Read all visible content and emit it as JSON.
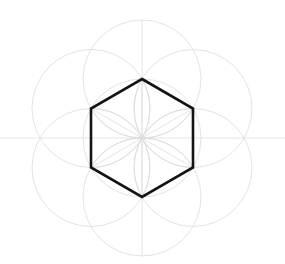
{
  "figure": {
    "background_color": "#ffffff"
  },
  "canvas": {
    "width": 285,
    "height": 264
  },
  "chart_data": {
    "type": "scatter",
    "xlabel": "",
    "ylabel": "",
    "xlim": [
      0,
      285
    ],
    "ylim": [
      0,
      264
    ],
    "grid": false,
    "legend": "none",
    "center": {
      "x": 142,
      "y": 138
    },
    "radius": 59,
    "hexagon": {
      "sides": 6,
      "orientation": "flat-left-right",
      "circumradius": 59,
      "stroke_color": "#141414",
      "stroke_width": 2.6,
      "vertices": [
        {
          "label": "top",
          "x": 142,
          "y": 79
        },
        {
          "label": "upper-right",
          "x": 193,
          "y": 108.5
        },
        {
          "label": "lower-right",
          "x": 193,
          "y": 167.5
        },
        {
          "label": "bottom",
          "x": 142,
          "y": 197
        },
        {
          "label": "lower-left",
          "x": 91,
          "y": 167.5
        },
        {
          "label": "upper-left",
          "x": 91,
          "y": 108.5
        }
      ]
    },
    "construction_circles": {
      "count": 7,
      "radius": 59,
      "stroke_color": "#e3e3e6",
      "centers": [
        {
          "label": "center",
          "x": 142,
          "y": 138
        },
        {
          "label": "vertex-top",
          "x": 142,
          "y": 79
        },
        {
          "label": "vertex-upper-right",
          "x": 193,
          "y": 108.5
        },
        {
          "label": "vertex-lower-right",
          "x": 193,
          "y": 167.5
        },
        {
          "label": "vertex-bottom",
          "x": 142,
          "y": 197
        },
        {
          "label": "vertex-lower-left",
          "x": 91,
          "y": 167.5
        },
        {
          "label": "vertex-upper-left",
          "x": 91,
          "y": 108.5
        }
      ]
    },
    "axes_lines": [
      {
        "label": "horizontal-axis",
        "x1": 0,
        "y1": 138,
        "x2": 285,
        "y2": 138
      },
      {
        "label": "vertical-axis",
        "x1": 142,
        "y1": 20,
        "x2": 142,
        "y2": 256
      }
    ],
    "petal_arc_count": 12,
    "spoke_count": 6,
    "colors": {
      "hexagon_stroke": "#141414",
      "guide_stroke": "#e3e3e6",
      "arc_stroke": "#dcdce0",
      "axis_stroke": "#e6e6e8",
      "background": "#ffffff"
    }
  }
}
